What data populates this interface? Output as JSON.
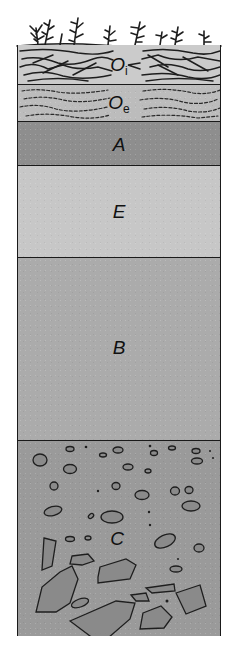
{
  "diagram": {
    "horizons": [
      {
        "id": "Oi",
        "letter": "O",
        "subscript": "i",
        "top": 0,
        "height": 39,
        "color": "#c9c9c9",
        "texture": "litter"
      },
      {
        "id": "Oe",
        "letter": "O",
        "subscript": "e",
        "top": 39,
        "height": 37,
        "color": "#b9b9b9",
        "texture": "fragmented"
      },
      {
        "id": "A",
        "letter": "A",
        "subscript": "",
        "top": 76,
        "height": 44,
        "color": "#8d8d8d",
        "texture": "fine"
      },
      {
        "id": "E",
        "letter": "E",
        "subscript": "",
        "top": 120,
        "height": 92,
        "color": "#c6c6c6",
        "texture": "fine"
      },
      {
        "id": "B",
        "letter": "B",
        "subscript": "",
        "top": 212,
        "height": 183,
        "color": "#aaaaaa",
        "texture": "fine"
      },
      {
        "id": "C",
        "letter": "C",
        "subscript": "",
        "top": 395,
        "height": 196,
        "color": "#999999",
        "texture": "rocks"
      }
    ],
    "surface": "vegetation",
    "outline_color": "#1a1a1a"
  }
}
